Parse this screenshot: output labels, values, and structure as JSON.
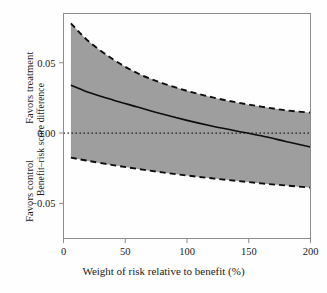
{
  "chart_data": {
    "type": "line",
    "title": "",
    "xlabel": "Weight of risk relative to benefit (%)",
    "ylabel": "Benefit–risk score difference",
    "xlim": [
      0,
      200
    ],
    "ylim": [
      -0.075,
      0.085
    ],
    "xticks": [
      0,
      50,
      100,
      150,
      200
    ],
    "xticklabels": [
      "0",
      "50",
      "100",
      "150",
      "200"
    ],
    "yticks": [
      0.05,
      0.0,
      -0.05
    ],
    "yticklabels": [
      "0.05",
      "0.00",
      "−0.05"
    ],
    "grid": false,
    "legend": null,
    "x": [
      6,
      20,
      40,
      60,
      80,
      100,
      120,
      140,
      160,
      180,
      200
    ],
    "series": [
      {
        "name": "Benefit–risk score difference (estimate)",
        "style": "solid",
        "values": [
          0.034,
          0.029,
          0.0235,
          0.0185,
          0.0135,
          0.009,
          0.005,
          0.0015,
          -0.002,
          -0.006,
          -0.01
        ]
      },
      {
        "name": "Upper confidence limit",
        "style": "dashed",
        "values": [
          0.078,
          0.0655,
          0.0525,
          0.0425,
          0.0355,
          0.03,
          0.0255,
          0.0218,
          0.0188,
          0.0162,
          0.0145
        ]
      },
      {
        "name": "Lower confidence limit",
        "style": "dashed",
        "values": [
          -0.0175,
          -0.0198,
          -0.0228,
          -0.0255,
          -0.028,
          -0.0302,
          -0.0322,
          -0.034,
          -0.0358,
          -0.0373,
          -0.0388
        ]
      }
    ],
    "reference_line": {
      "y": 0.0,
      "style": "dotted",
      "label": "no difference"
    },
    "band": {
      "fill_color": "#9e9e9e",
      "between": [
        "Upper confidence limit",
        "Lower confidence limit"
      ]
    },
    "annotations": {
      "favors_treatment": "Favors treatment",
      "favors_control": "Favors control"
    },
    "colors": {
      "band_fill": "#9e9e9e",
      "line": "#0d0d0d",
      "axis": "#8c8c8c",
      "text": "#1a1a1a",
      "background": "#ffffff"
    }
  }
}
